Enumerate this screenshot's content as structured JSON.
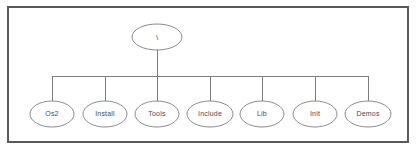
{
  "diagram": {
    "type": "tree",
    "background_color": "#ffffff",
    "frame": {
      "name": "diagram-border",
      "x": 8,
      "y": 7,
      "width": 400,
      "height": 135,
      "stroke_color": "#5a5a5a"
    },
    "style": {
      "node_stroke_color": "#7d7d7d",
      "node_fill_color": "#ffffff",
      "connector_color": "#7d7d7d",
      "label_color": "#4a4a4a"
    },
    "root": {
      "label": "\\",
      "cx": 157,
      "cy": 37,
      "rx": 25,
      "ry": 13
    },
    "trunk": {
      "from_y": 50,
      "to_y": 76,
      "x": 157
    },
    "bus": {
      "y": 76,
      "x_start": 52,
      "x_end": 368
    },
    "children": [
      {
        "label": "Os2",
        "cx": 52,
        "cy": 114,
        "rx": 22,
        "ry": 13
      },
      {
        "label": "Install",
        "cx": 105,
        "cy": 114,
        "rx": 22,
        "ry": 13
      },
      {
        "label": "Tools",
        "cx": 157,
        "cy": 114,
        "rx": 22,
        "ry": 13
      },
      {
        "label": "Include",
        "cx": 210,
        "cy": 114,
        "rx": 23,
        "ry": 13
      },
      {
        "label": "Lib",
        "cx": 262,
        "cy": 114,
        "rx": 22,
        "ry": 13
      },
      {
        "label": "Init",
        "cx": 315,
        "cy": 114,
        "rx": 22,
        "ry": 13
      },
      {
        "label": "Demos",
        "cx": 368,
        "cy": 114,
        "rx": 23,
        "ry": 13
      }
    ]
  }
}
